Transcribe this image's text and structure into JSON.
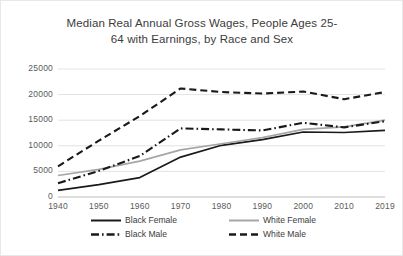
{
  "chart_data": {
    "type": "line",
    "title_line1": "Median Real Annual Gross Wages, People Ages 25-",
    "title_line2": "64 with Earnings, by Race and Sex",
    "xlabel": "",
    "ylabel": "",
    "x": [
      1940,
      1950,
      1960,
      1970,
      1980,
      1990,
      2000,
      2010,
      2019
    ],
    "categories": [
      "1940",
      "1950",
      "1960",
      "1970",
      "1980",
      "1990",
      "2000",
      "2010",
      "2019"
    ],
    "yticks": [
      0,
      5000,
      10000,
      15000,
      20000,
      25000
    ],
    "ytick_labels": [
      "0",
      "5000",
      "10000",
      "15000",
      "20000",
      "25000"
    ],
    "ylim": [
      0,
      25000
    ],
    "grid": true,
    "legend_position": "bottom",
    "series": [
      {
        "name": "Black Female",
        "style": "solid",
        "color": "#1a1a1a",
        "values": [
          1300,
          2400,
          3800,
          7800,
          10100,
          11200,
          12700,
          12600,
          13000
        ]
      },
      {
        "name": "White Female",
        "style": "solid",
        "color": "#a6a6a6",
        "values": [
          4200,
          5400,
          7000,
          9200,
          10400,
          11600,
          13200,
          13700,
          15000
        ]
      },
      {
        "name": "Black Male",
        "style": "dashdot",
        "color": "#1a1a1a",
        "values": [
          2700,
          5100,
          8000,
          13400,
          13200,
          13000,
          14500,
          13600,
          14800
        ]
      },
      {
        "name": "White Male",
        "style": "dashed",
        "color": "#1a1a1a",
        "values": [
          6000,
          11000,
          15800,
          21200,
          20500,
          20200,
          20600,
          19100,
          20500
        ]
      }
    ]
  },
  "legend": {
    "items": [
      {
        "label": "Black Female",
        "style": "solid",
        "color": "#1a1a1a"
      },
      {
        "label": "Black Male",
        "style": "dashdot",
        "color": "#1a1a1a"
      },
      {
        "label": "White Female",
        "style": "solid",
        "color": "#a6a6a6"
      },
      {
        "label": "White Male",
        "style": "dashed",
        "color": "#1a1a1a"
      }
    ]
  }
}
